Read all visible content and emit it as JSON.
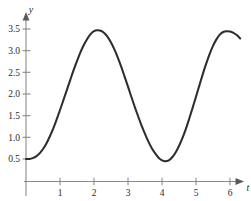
{
  "chart_data": {
    "type": "line",
    "title": "",
    "subtitle": "",
    "xlabel": "t",
    "ylabel": "y",
    "grid": false,
    "legend": null,
    "background_color": "#ffffff",
    "curve_color": "#2e2c2c",
    "axis_color": "#8a8a8a",
    "xlim": [
      0,
      6.35
    ],
    "ylim": [
      0,
      3.75
    ],
    "x_ticks": [
      1,
      2,
      3,
      4,
      5,
      6
    ],
    "x_tick_labels": [
      "1",
      "2",
      "3",
      "4",
      "5",
      "6"
    ],
    "y_ticks": [
      0.5,
      1.0,
      1.5,
      2.0,
      2.5,
      3.0,
      3.5
    ],
    "y_tick_labels": [
      "0.5",
      "1.0",
      "1.5",
      "2.0",
      "2.5",
      "3.0",
      "3.5"
    ],
    "annotations": [],
    "features": {
      "start_point": [
        0,
        0.5
      ],
      "first_peak": [
        2.05,
        3.47
      ],
      "trough": [
        4.0,
        0.45
      ],
      "second_peak": [
        6.05,
        3.43
      ],
      "end_point": [
        6.3,
        3.28
      ]
    },
    "series": [
      {
        "name": "y(t)",
        "x": [
          0.0,
          0.1,
          0.2,
          0.3,
          0.4,
          0.5,
          0.6,
          0.7,
          0.8,
          0.9,
          1.0,
          1.1,
          1.2,
          1.3,
          1.4,
          1.5,
          1.6,
          1.7,
          1.8,
          1.9,
          2.0,
          2.1,
          2.2,
          2.3,
          2.4,
          2.5,
          2.6,
          2.7,
          2.8,
          2.9,
          3.0,
          3.1,
          3.2,
          3.3,
          3.4,
          3.5,
          3.6,
          3.7,
          3.8,
          3.9,
          4.0,
          4.1,
          4.2,
          4.3,
          4.4,
          4.5,
          4.6,
          4.7,
          4.8,
          4.9,
          5.0,
          5.1,
          5.2,
          5.3,
          5.4,
          5.5,
          5.6,
          5.7,
          5.8,
          5.9,
          6.0,
          6.1,
          6.2,
          6.3
        ],
        "y": [
          0.5,
          0.5,
          0.52,
          0.56,
          0.63,
          0.73,
          0.86,
          1.02,
          1.2,
          1.41,
          1.63,
          1.86,
          2.09,
          2.32,
          2.55,
          2.76,
          2.96,
          3.13,
          3.27,
          3.38,
          3.45,
          3.47,
          3.46,
          3.41,
          3.32,
          3.19,
          3.03,
          2.84,
          2.63,
          2.4,
          2.17,
          1.93,
          1.7,
          1.48,
          1.27,
          1.08,
          0.9,
          0.75,
          0.63,
          0.53,
          0.47,
          0.45,
          0.47,
          0.54,
          0.65,
          0.8,
          0.98,
          1.19,
          1.43,
          1.68,
          1.94,
          2.2,
          2.46,
          2.7,
          2.92,
          3.11,
          3.26,
          3.37,
          3.43,
          3.45,
          3.44,
          3.41,
          3.36,
          3.28
        ]
      }
    ]
  },
  "axis_labels": {
    "x_name": "t",
    "y_name": "y"
  }
}
